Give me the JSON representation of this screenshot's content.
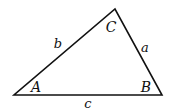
{
  "diagram": {
    "type": "triangle",
    "stroke_color": "#111111",
    "vertices": [
      {
        "id": "A",
        "label": "A",
        "x": 14,
        "y": 95,
        "label_x": 36,
        "label_y": 92
      },
      {
        "id": "B",
        "label": "B",
        "x": 162,
        "y": 95,
        "label_x": 146,
        "label_y": 92
      },
      {
        "id": "C",
        "label": "C",
        "x": 115,
        "y": 9,
        "label_x": 111,
        "label_y": 32
      }
    ],
    "sides": [
      {
        "id": "a",
        "label": "a",
        "from": "B",
        "to": "C",
        "label_x": 145,
        "label_y": 52
      },
      {
        "id": "b",
        "label": "b",
        "from": "A",
        "to": "C",
        "label_x": 58,
        "label_y": 48
      },
      {
        "id": "c",
        "label": "c",
        "from": "A",
        "to": "B",
        "label_x": 88,
        "label_y": 108
      }
    ]
  }
}
